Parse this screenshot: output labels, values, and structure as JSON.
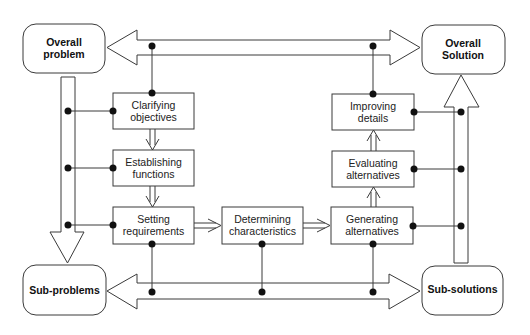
{
  "diagram": {
    "type": "design-process-model",
    "colors": {
      "stroke": "#3a3a3a",
      "fill": "#ffffff",
      "dot": "#111111",
      "text": "#222222"
    },
    "terminals": {
      "overall_problem": {
        "line1": "Overall",
        "line2": "problem"
      },
      "overall_solution": {
        "line1": "Overall",
        "line2": "Solution"
      },
      "sub_problems": {
        "label": "Sub-problems"
      },
      "sub_solutions": {
        "label": "Sub-solutions"
      }
    },
    "stages": [
      {
        "id": "clarifying",
        "line1": "Clarifying",
        "line2": "objectives"
      },
      {
        "id": "establishing",
        "line1": "Establishing",
        "line2": "functions"
      },
      {
        "id": "setting",
        "line1": "Setting",
        "line2": "requirements"
      },
      {
        "id": "determining",
        "line1": "Determining",
        "line2": "characteristics"
      },
      {
        "id": "generating",
        "line1": "Generating",
        "line2": "alternatives"
      },
      {
        "id": "evaluating",
        "line1": "Evaluating",
        "line2": "alternatives"
      },
      {
        "id": "improving",
        "line1": "Improving",
        "line2": "details"
      }
    ],
    "flows": [
      {
        "from": "Clarifying objectives",
        "to": "Establishing functions"
      },
      {
        "from": "Establishing functions",
        "to": "Setting requirements"
      },
      {
        "from": "Setting requirements",
        "to": "Determining characteristics"
      },
      {
        "from": "Determining characteristics",
        "to": "Generating alternatives"
      },
      {
        "from": "Generating alternatives",
        "to": "Evaluating alternatives"
      },
      {
        "from": "Evaluating alternatives",
        "to": "Improving details"
      },
      {
        "from": "Overall problem",
        "to": "Sub-problems"
      },
      {
        "from": "Sub-solutions",
        "to": "Overall Solution"
      },
      {
        "between": [
          "Overall problem",
          "Overall Solution"
        ],
        "kind": "double-headed"
      },
      {
        "between": [
          "Sub-problems",
          "Sub-solutions"
        ],
        "kind": "double-headed"
      }
    ]
  }
}
